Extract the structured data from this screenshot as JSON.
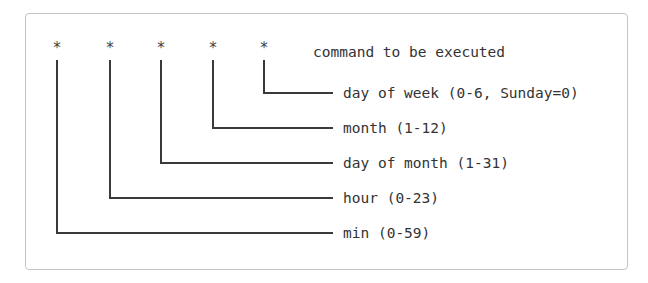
{
  "diagram": {
    "stars": [
      "*",
      "*",
      "*",
      "*",
      "*"
    ],
    "command_label": "command to be executed",
    "fields": [
      {
        "name": "day-of-week",
        "label": "day of week (0-6, Sunday=0)"
      },
      {
        "name": "month",
        "label": "month (1-12)"
      },
      {
        "name": "day-of-month",
        "label": "day of month (1-31)"
      },
      {
        "name": "hour",
        "label": "hour (0-23)"
      },
      {
        "name": "min",
        "label": "min (0-59)"
      }
    ],
    "colors": {
      "line": "#3a3a3a",
      "text": "#333333",
      "border": "#c4c4c4"
    }
  }
}
